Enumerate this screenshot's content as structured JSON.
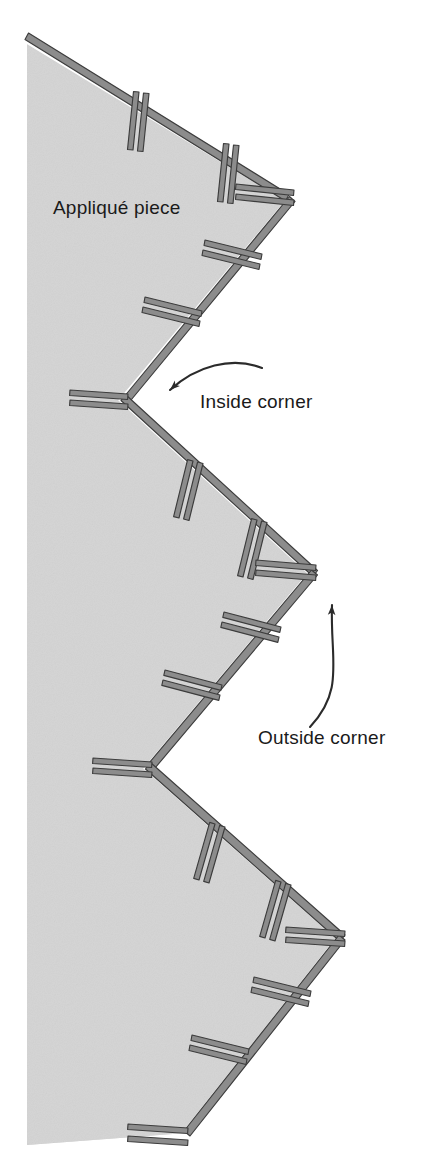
{
  "figure": {
    "background_color": "#ffffff"
  },
  "labels": {
    "applique_piece": "Appliqué piece",
    "inside_corner": "Inside corner",
    "outside_corner": "Outside corner"
  },
  "colors": {
    "fabric_fill": "#d4d4d4",
    "fabric_edge_highlight": "#ffffff",
    "stitch_fill": "#8c8c8c",
    "stitch_stroke": "#3c3c3c",
    "text": "#1a1a1a",
    "arrow": "#2b2b2b",
    "page_background": "#ffffff"
  },
  "geometry": {
    "canvas": {
      "width": 421,
      "height": 1164
    },
    "fabric_left_x": 27,
    "fabric_top_y": 40,
    "fabric_bottom_y": 1145,
    "zigzag_vertices": [
      {
        "name": "top-edge-start",
        "x": 27,
        "y": 40,
        "kind": "edge"
      },
      {
        "name": "outside-corner-1",
        "x": 290,
        "y": 200,
        "kind": "outside"
      },
      {
        "name": "inside-corner-1",
        "x": 123,
        "y": 400,
        "kind": "inside"
      },
      {
        "name": "outside-corner-2",
        "x": 312,
        "y": 573,
        "kind": "outside"
      },
      {
        "name": "inside-corner-2",
        "x": 148,
        "y": 768,
        "kind": "inside"
      },
      {
        "name": "outside-corner-3",
        "x": 340,
        "y": 938,
        "kind": "outside"
      },
      {
        "name": "inside-corner-3",
        "x": 186,
        "y": 1133,
        "kind": "inside"
      },
      {
        "name": "bottom-edge-end",
        "x": 27,
        "y": 1145,
        "kind": "edge"
      }
    ]
  },
  "annotations": [
    {
      "id": "inside-corner-callout",
      "label": "Inside corner",
      "text_x": 200,
      "text_y": 408,
      "arrow_tip": {
        "x": 153,
        "y": 397
      },
      "arrow_tail": {
        "x": 262,
        "y": 368
      },
      "arrow_style": "curved-left"
    },
    {
      "id": "outside-corner-callout",
      "label": "Outside corner",
      "text_x": 258,
      "text_y": 744,
      "arrow_tip": {
        "x": 333,
        "y": 588
      },
      "arrow_tail": {
        "x": 310,
        "y": 727
      },
      "arrow_style": "curved-up"
    }
  ],
  "piece_label": {
    "label": "Appliqué piece",
    "x": 53,
    "y": 214
  }
}
